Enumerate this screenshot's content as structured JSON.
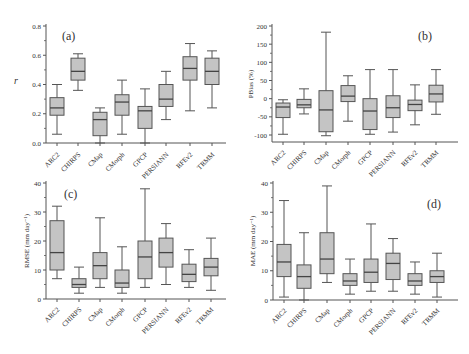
{
  "figure": {
    "categories": [
      "ARC2",
      "CHIRPS",
      "CMap",
      "CMorph",
      "GPCP",
      "PERSIANN",
      "RFEv2",
      "TRMM"
    ],
    "box_fill": "#c4c4c4",
    "line_color": "#555555"
  },
  "chart_data": [
    {
      "type": "box",
      "panel": "(a)",
      "title": "",
      "xlabel": "",
      "ylabel": "r",
      "ylim": [
        0,
        0.8
      ],
      "yticks": [
        0.0,
        0.2,
        0.4,
        0.6,
        0.8
      ],
      "ytick_labels": [
        "0.0",
        "0.2",
        "0.4",
        "0.6",
        "0.8"
      ],
      "categories": [
        "ARC2",
        "CHIRPS",
        "CMap",
        "CMorph",
        "GPCP",
        "PERSIANN",
        "RFEv2",
        "TRMM"
      ],
      "boxes": [
        {
          "name": "ARC2",
          "min": 0.06,
          "q1": 0.19,
          "median": 0.24,
          "q3": 0.31,
          "max": 0.4
        },
        {
          "name": "CHIRPS",
          "min": 0.36,
          "q1": 0.43,
          "median": 0.49,
          "q3": 0.58,
          "max": 0.61
        },
        {
          "name": "CMap",
          "min": 0.0,
          "q1": 0.05,
          "median": 0.16,
          "q3": 0.21,
          "max": 0.24
        },
        {
          "name": "CMorph",
          "min": 0.06,
          "q1": 0.19,
          "median": 0.28,
          "q3": 0.33,
          "max": 0.43
        },
        {
          "name": "GPCP",
          "min": 0.0,
          "q1": 0.1,
          "median": 0.22,
          "q3": 0.25,
          "max": 0.37
        },
        {
          "name": "PERSIANN",
          "min": 0.16,
          "q1": 0.25,
          "median": 0.3,
          "q3": 0.4,
          "max": 0.49
        },
        {
          "name": "RFEv2",
          "min": 0.22,
          "q1": 0.43,
          "median": 0.51,
          "q3": 0.59,
          "max": 0.68
        },
        {
          "name": "TRMM",
          "min": 0.24,
          "q1": 0.4,
          "median": 0.49,
          "q3": 0.58,
          "max": 0.63
        }
      ]
    },
    {
      "type": "box",
      "panel": "(b)",
      "title": "",
      "xlabel": "",
      "ylabel": "PBias (%)",
      "ylim": [
        -120,
        200
      ],
      "yticks": [
        -100,
        -50,
        0,
        50,
        100,
        150,
        200
      ],
      "ytick_labels": [
        "-100",
        "-50",
        "0",
        "50",
        "100",
        "150",
        "200"
      ],
      "categories": [
        "ARC2",
        "CHIRPS",
        "CMap",
        "CMorph",
        "GPCP",
        "PERSIANN",
        "RFEv2",
        "TRMM"
      ],
      "boxes": [
        {
          "name": "ARC2",
          "min": -98,
          "q1": -52,
          "median": -23,
          "q3": -12,
          "max": -3
        },
        {
          "name": "CHIRPS",
          "min": -42,
          "q1": -25,
          "median": -17,
          "q3": -2,
          "max": 27
        },
        {
          "name": "CMap",
          "min": -102,
          "q1": -91,
          "median": -31,
          "q3": 22,
          "max": 183
        },
        {
          "name": "CMorph",
          "min": -62,
          "q1": -8,
          "median": 7,
          "q3": 36,
          "max": 63
        },
        {
          "name": "GPCP",
          "min": -98,
          "q1": -85,
          "median": -34,
          "q3": 0,
          "max": 80
        },
        {
          "name": "PERSIANN",
          "min": -92,
          "q1": -52,
          "median": -25,
          "q3": 8,
          "max": 80
        },
        {
          "name": "RFEv2",
          "min": -72,
          "q1": -33,
          "median": -16,
          "q3": -4,
          "max": 38
        },
        {
          "name": "TRMM",
          "min": -43,
          "q1": -9,
          "median": 13,
          "q3": 37,
          "max": 80
        }
      ]
    },
    {
      "type": "box",
      "panel": "(c)",
      "title": "",
      "xlabel": "",
      "ylabel": "RMSE (mm day⁻¹)",
      "ylim": [
        0,
        40
      ],
      "yticks": [
        0,
        10,
        20,
        30,
        40
      ],
      "ytick_labels": [
        "0",
        "10",
        "20",
        "30",
        "40"
      ],
      "categories": [
        "ARC2",
        "CHIRPS",
        "CMap",
        "CMorph",
        "GPCP",
        "PERSIANN",
        "RFEv2",
        "TRMM"
      ],
      "boxes": [
        {
          "name": "ARC2",
          "min": 7,
          "q1": 10,
          "median": 16,
          "q3": 27,
          "max": 32
        },
        {
          "name": "CHIRPS",
          "min": 2,
          "q1": 4,
          "median": 5,
          "q3": 7,
          "max": 11
        },
        {
          "name": "CMap",
          "min": 4,
          "q1": 7,
          "median": 11.5,
          "q3": 16,
          "max": 28
        },
        {
          "name": "CMorph",
          "min": 2,
          "q1": 4,
          "median": 5.5,
          "q3": 10,
          "max": 18
        },
        {
          "name": "GPCP",
          "min": 4,
          "q1": 7,
          "median": 14.5,
          "q3": 20,
          "max": 38
        },
        {
          "name": "PERSIANN",
          "min": 5,
          "q1": 11,
          "median": 16,
          "q3": 21,
          "max": 26
        },
        {
          "name": "RFEv2",
          "min": 4,
          "q1": 6,
          "median": 8.5,
          "q3": 12,
          "max": 17
        },
        {
          "name": "TRMM",
          "min": 3,
          "q1": 8,
          "median": 11,
          "q3": 14,
          "max": 21
        }
      ]
    },
    {
      "type": "box",
      "panel": "(d)",
      "title": "",
      "xlabel": "",
      "ylabel": "MAE (mm day⁻¹)",
      "ylim": [
        0,
        40
      ],
      "yticks": [
        0,
        10,
        20,
        30,
        40
      ],
      "ytick_labels": [
        "0",
        "10",
        "20",
        "30",
        "40"
      ],
      "categories": [
        "ARC2",
        "CHIRPS",
        "CMap",
        "CMorph",
        "GPCP",
        "PERSIANN",
        "RFEv2",
        "TRMM"
      ],
      "boxes": [
        {
          "name": "ARC2",
          "min": 1,
          "q1": 8,
          "median": 13,
          "q3": 19,
          "max": 34
        },
        {
          "name": "CHIRPS",
          "min": 0,
          "q1": 4,
          "median": 8,
          "q3": 12,
          "max": 23
        },
        {
          "name": "CMap",
          "min": 6,
          "q1": 9,
          "median": 14,
          "q3": 23,
          "max": 39
        },
        {
          "name": "CMorph",
          "min": 2,
          "q1": 5,
          "median": 6.5,
          "q3": 9,
          "max": 14
        },
        {
          "name": "GPCP",
          "min": 3,
          "q1": 6,
          "median": 9.5,
          "q3": 14,
          "max": 26
        },
        {
          "name": "PERSIANN",
          "min": 3,
          "q1": 7,
          "median": 12.5,
          "q3": 16,
          "max": 21
        },
        {
          "name": "RFEv2",
          "min": 2,
          "q1": 5,
          "median": 6.5,
          "q3": 9,
          "max": 13
        },
        {
          "name": "TRMM",
          "min": 1,
          "q1": 6,
          "median": 8,
          "q3": 10,
          "max": 16
        }
      ]
    }
  ]
}
